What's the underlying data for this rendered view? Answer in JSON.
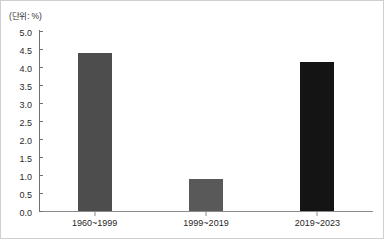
{
  "figure": {
    "unit_label": "(단위: %)",
    "background": "#ffffff",
    "border_color": "#cfcfcf",
    "axis_color": "#6f6f6f"
  },
  "chart_data": {
    "type": "bar",
    "title": "",
    "subtitle": "",
    "xlabel": "",
    "ylabel": "",
    "unit_note": "(단위: %)",
    "categories": [
      "1960~1999",
      "1999~2019",
      "2019~2023"
    ],
    "values": [
      4.4,
      0.9,
      4.15
    ],
    "colors": [
      "#4d4d4d",
      "#595959",
      "#141414"
    ],
    "ylim": [
      0.0,
      5.0
    ],
    "ytick_labels": [
      "0.0",
      "0.5",
      "1.0",
      "1.5",
      "2.0",
      "2.5",
      "3.0",
      "3.5",
      "4.0",
      "4.5",
      "5.0"
    ],
    "ytick_values": [
      0.0,
      0.5,
      1.0,
      1.5,
      2.0,
      2.5,
      3.0,
      3.5,
      4.0,
      4.5,
      5.0
    ],
    "grid": false,
    "legend": null,
    "legend_position": "none",
    "annotations": []
  }
}
